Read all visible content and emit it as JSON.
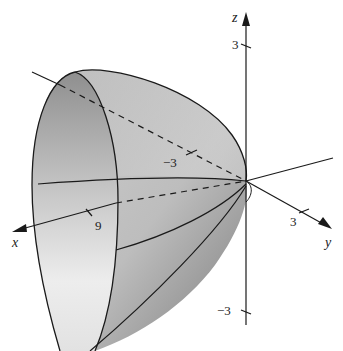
{
  "figure": {
    "axes": {
      "x": {
        "label": "x",
        "tick_label": "9"
      },
      "y": {
        "label": "y",
        "tick_label_pos": "3",
        "tick_label_neg": "−3"
      },
      "z": {
        "label": "z",
        "tick_label_pos": "3",
        "tick_label_neg": "−3"
      }
    },
    "colors": {
      "surface_light": "#eeeeee",
      "surface_dark": "#8a8a8a",
      "line": "#1a1a1a"
    }
  }
}
